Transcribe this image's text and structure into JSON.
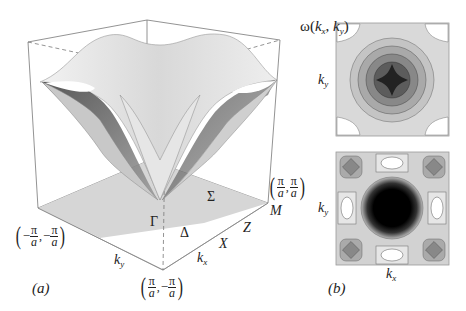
{
  "figure": {
    "panel_a": {
      "label": "(a)",
      "z_axis_label": {
        "func": "ω",
        "open": "(",
        "k1": "k",
        "s1": "x",
        "sep": ", ",
        "k2": "k",
        "s2": "y",
        "close": ")"
      },
      "points": {
        "gamma": "Γ",
        "delta": "Δ",
        "sigma": "Σ",
        "x": "X",
        "z": "Z",
        "m": "M"
      },
      "axes": {
        "kx": {
          "k": "k",
          "sub": "x"
        },
        "ky": {
          "k": "k",
          "sub": "y"
        }
      },
      "corners": {
        "left": {
          "sign1": "−",
          "num1": "π",
          "den1": "a",
          "sign2": "−",
          "num2": "π",
          "den2": "a"
        },
        "front": {
          "sign1": "",
          "num1": "π",
          "den1": "a",
          "sign2": "−",
          "num2": "π",
          "den2": "a"
        },
        "right": {
          "sign1": "",
          "num1": "π",
          "den1": "a",
          "sign2": "",
          "num2": "π",
          "den2": "a"
        }
      }
    },
    "panel_b": {
      "label": "(b)",
      "top_plot": {
        "ylabel": {
          "k": "k",
          "sub": "y"
        }
      },
      "bottom_plot": {
        "ylabel": {
          "k": "k",
          "sub": "y"
        },
        "xlabel": {
          "k": "k",
          "sub": "x"
        }
      }
    },
    "colors": {
      "surface_light": "#e8e8e8",
      "surface_dark": "#5a5a5a",
      "floor": "#d6d6d6",
      "box_line": "#777777",
      "contour_line": "#666666"
    }
  }
}
